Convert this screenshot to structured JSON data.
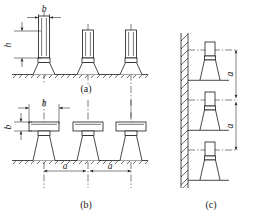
{
  "figure": {
    "panels": [
      {
        "id": "a",
        "caption": "(a)",
        "description": "Three vertical tall posts on trapezoidal bases standing on hatched ground line",
        "dimensions": [
          {
            "label": "b",
            "orientation": "horizontal",
            "position": "top-first-post",
            "meaning": "post width"
          },
          {
            "label": "h",
            "orientation": "vertical",
            "position": "left-first-post",
            "meaning": "post height"
          }
        ],
        "unit_count": 3
      },
      {
        "id": "b",
        "caption": "(b)",
        "description": "Three horizontal flat plates on trapezoidal bases standing on hatched ground line",
        "dimensions": [
          {
            "label": "h",
            "orientation": "horizontal",
            "position": "top-first-unit",
            "meaning": "plate length"
          },
          {
            "label": "b",
            "orientation": "vertical",
            "position": "left-first-unit",
            "meaning": "plate thickness"
          },
          {
            "label": "a",
            "orientation": "horizontal",
            "position": "spacing-1-2",
            "meaning": "centre spacing"
          },
          {
            "label": "a",
            "orientation": "horizontal",
            "position": "spacing-2-3",
            "meaning": "centre spacing"
          }
        ],
        "unit_count": 3
      },
      {
        "id": "c",
        "caption": "(c)",
        "description": "Vertical hatched wall with three bracket supports mounted on ledges",
        "dimensions": [
          {
            "label": "a",
            "orientation": "vertical",
            "position": "spacing-1-2",
            "meaning": "centre spacing"
          },
          {
            "label": "a",
            "orientation": "vertical",
            "position": "spacing-2-3",
            "meaning": "centre spacing"
          }
        ],
        "unit_count": 3
      }
    ],
    "labels": {
      "b": "b",
      "h": "h",
      "a": "a",
      "caption_a": "(a)",
      "caption_b": "(b)",
      "caption_c": "(c)"
    },
    "colors": {
      "line": "#1a1a1a",
      "background": "#ffffff",
      "hatch": "#2a2a2a"
    }
  }
}
